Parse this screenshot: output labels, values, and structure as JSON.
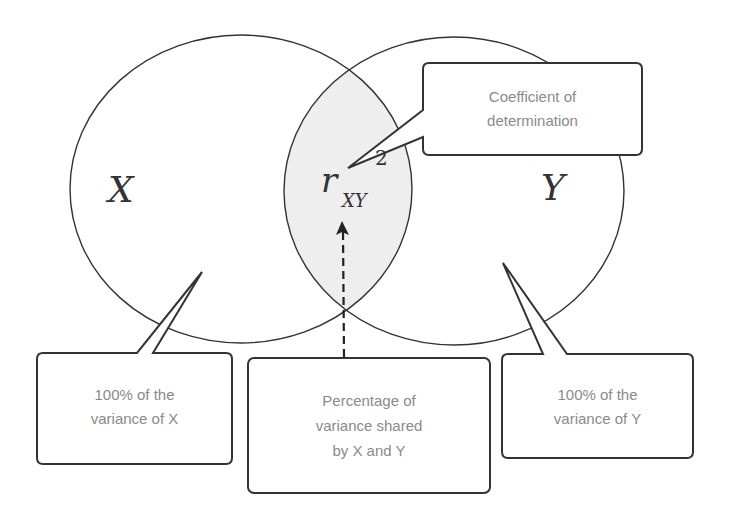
{
  "diagram": {
    "type": "venn",
    "colors": {
      "outline": "#333333",
      "overlap_fill": "#eeeeee",
      "label_text": "#8a8a8a",
      "glyph_text": "#333333",
      "background": "#ffffff"
    },
    "sets": [
      {
        "id": "X",
        "label": "X"
      },
      {
        "id": "Y",
        "label": "Y"
      }
    ],
    "overlap": {
      "symbol": "r",
      "subscript": "XY",
      "superscript": "2"
    },
    "callouts": {
      "coefficient": {
        "lines": [
          "Coefficient of",
          "determination"
        ]
      },
      "variance_x": {
        "lines": [
          "100% of the",
          "variance of X"
        ]
      },
      "shared": {
        "lines": [
          "Percentage of",
          "variance shared",
          "by X and Y"
        ]
      },
      "variance_y": {
        "lines": [
          "100% of the",
          "variance of Y"
        ]
      }
    }
  }
}
